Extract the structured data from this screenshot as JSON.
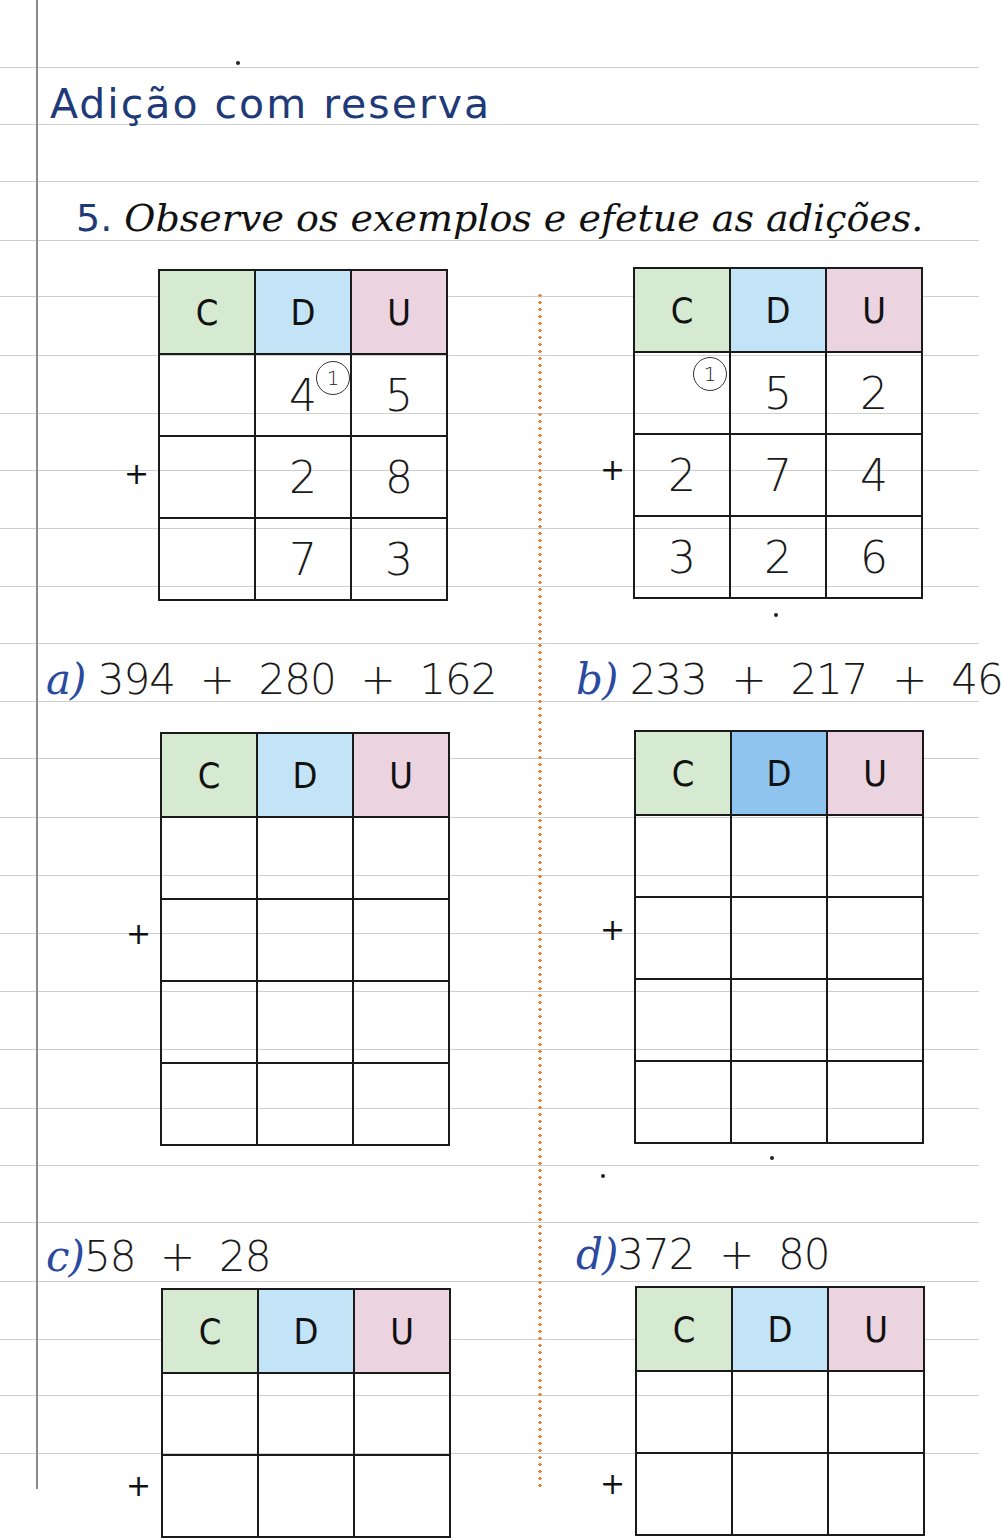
{
  "page": {
    "title": "Adição com reserva",
    "instruction": {
      "number": "5.",
      "text": "Observe os exemplos e efetue as adições."
    }
  },
  "columns": [
    "C",
    "D",
    "U"
  ],
  "plus_sign": "+",
  "examples": [
    {
      "id": "example-1",
      "carry": {
        "column": "D",
        "value": "1"
      },
      "rows": [
        [
          "",
          "4",
          "5"
        ],
        [
          "",
          "2",
          "8"
        ],
        [
          "",
          "7",
          "3"
        ]
      ]
    },
    {
      "id": "example-2",
      "carry": {
        "column": "C",
        "value": "1"
      },
      "rows": [
        [
          "",
          "5",
          "2"
        ],
        [
          "2",
          "7",
          "4"
        ],
        [
          "3",
          "2",
          "6"
        ]
      ]
    }
  ],
  "exercises": [
    {
      "label": "a)",
      "expression": "394  +  280  +  162",
      "rows": [
        [
          "",
          "",
          ""
        ],
        [
          "",
          "",
          ""
        ],
        [
          "",
          "",
          ""
        ],
        [
          "",
          "",
          ""
        ]
      ]
    },
    {
      "label": "b)",
      "expression": "233  +  217  +  46",
      "rows": [
        [
          "",
          "",
          ""
        ],
        [
          "",
          "",
          ""
        ],
        [
          "",
          "",
          ""
        ],
        [
          "",
          "",
          ""
        ]
      ]
    },
    {
      "label": "c)",
      "expression": "58  +  28",
      "rows": [
        [
          "",
          "",
          ""
        ],
        [
          "",
          "",
          ""
        ]
      ]
    },
    {
      "label": "d)",
      "expression": "372  +  80",
      "rows": [
        [
          "",
          "",
          ""
        ],
        [
          "",
          "",
          ""
        ]
      ]
    }
  ],
  "colors": {
    "title": "#1f3a78",
    "divider": "#e8823a",
    "header_c": "#d6ead2",
    "header_d": "#c3e3f7",
    "header_u": "#ecd3e0"
  }
}
